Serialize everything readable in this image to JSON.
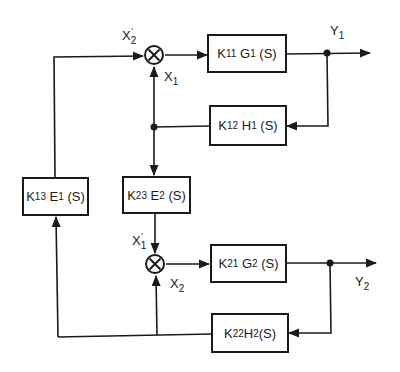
{
  "diagram": {
    "type": "block-diagram",
    "line_color": "#1a1a1a",
    "background": "#ffffff",
    "blocks": [
      {
        "id": "k11g1",
        "k": "K",
        "k_sub": "11",
        "fn": "G",
        "fn_sub": "1",
        "arg": "(S)"
      },
      {
        "id": "k12h1",
        "k": "K",
        "k_sub": "12",
        "fn": "H",
        "fn_sub": "1",
        "arg": "(S)"
      },
      {
        "id": "k23e2",
        "k": "K",
        "k_sub": "23",
        "fn": "E",
        "fn_sub": "2",
        "arg": "(S)"
      },
      {
        "id": "k13e1",
        "k": "K",
        "k_sub": "13",
        "fn": "E",
        "fn_sub": "1",
        "arg": "(S)"
      },
      {
        "id": "k21g2",
        "k": "K",
        "k_sub": "21",
        "fn": "G",
        "fn_sub": "2",
        "arg": "(S)"
      },
      {
        "id": "k22h2",
        "k": "K",
        "k_sub": "22",
        "fn": "H",
        "fn_sub": "2",
        "arg": "(S)"
      }
    ],
    "signals": {
      "x2p": {
        "base": "X",
        "sub": "2",
        "prime": "'"
      },
      "x1": {
        "base": "X",
        "sub": "1"
      },
      "x1p": {
        "base": "X",
        "sub": "1",
        "prime": "'"
      },
      "x2": {
        "base": "X",
        "sub": "2"
      },
      "y1": {
        "base": "Y",
        "sub": "1"
      },
      "y2": {
        "base": "Y",
        "sub": "2"
      }
    },
    "summing_junctions": [
      {
        "id": "sum1",
        "symbol": "⊗"
      },
      {
        "id": "sum2",
        "symbol": "⊗"
      }
    ]
  }
}
